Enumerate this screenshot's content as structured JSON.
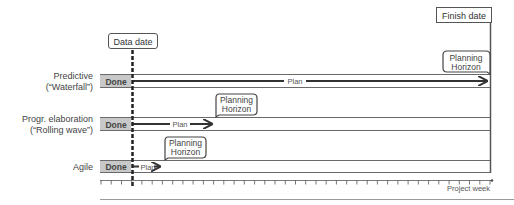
{
  "diagram": {
    "markers": {
      "data_date": {
        "label": "Data date",
        "x": 132
      },
      "finish_date": {
        "label": "Finish date",
        "x": 490
      }
    },
    "rows": [
      {
        "label_line1": "Predictive",
        "label_line2": "(“Waterfall”)",
        "done_label": "Done",
        "plan_label": "Plan",
        "horizon_line1": "Planning",
        "horizon_line2": "Horizon"
      },
      {
        "label_line1": "Progr. elaboration",
        "label_line2": "(“Rolling wave”)",
        "done_label": "Done",
        "plan_label": "Plan",
        "horizon_line1": "Planning",
        "horizon_line2": "Horizon"
      },
      {
        "label_line1": "Agile",
        "label_line2": "",
        "done_label": "Done",
        "plan_label": "Plan",
        "horizon_line1": "Planning",
        "horizon_line2": "Horizon"
      }
    ],
    "axis": {
      "label": "Project week",
      "tick_count": 39
    }
  },
  "colors": {
    "done_fill": "#c8c8c8",
    "line": "#333333",
    "lane": "#555555",
    "text": "#333333",
    "rule": "#999999"
  }
}
